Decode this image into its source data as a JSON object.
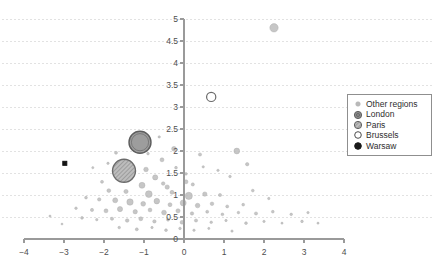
{
  "chart_data": {
    "type": "scatter",
    "title": "",
    "subtitle": "",
    "xlabel": "",
    "ylabel": "",
    "xlim": [
      -4,
      4
    ],
    "ylim": [
      0,
      5
    ],
    "xticks": [
      -4,
      -3,
      -2,
      -1,
      0,
      1,
      2,
      3,
      4
    ],
    "xtick_labels": [
      "−4",
      "−3",
      "−2",
      "−1",
      "0",
      "1",
      "2",
      "3",
      "4"
    ],
    "yticks": [
      0,
      0.5,
      1,
      1.5,
      2,
      2.5,
      3,
      3.5,
      4,
      4.5,
      5
    ],
    "ytick_labels": [
      "0",
      "0.5",
      "1",
      "1.5",
      "2",
      "2.5",
      "3",
      "3.5",
      "4",
      "4.5",
      "5"
    ],
    "grid": {
      "horizontal": true,
      "vertical": false,
      "style": "dotted",
      "color": "#e2e2e2"
    },
    "legend": {
      "position": "top-right",
      "border": true,
      "entries": [
        {
          "label": "Other regions",
          "marker": "filled-circle-small",
          "color": "#b9b9b9"
        },
        {
          "label": "London",
          "marker": "filled-circle-ring",
          "color": "#8c8c8c"
        },
        {
          "label": "Paris",
          "marker": "hatched-circle",
          "color": "#9a9a9a"
        },
        {
          "label": "Brussels",
          "marker": "open-circle",
          "color": "#ffffff"
        },
        {
          "label": "Warsaw",
          "marker": "filled-circle-black",
          "color": "#1a1a1a"
        }
      ]
    },
    "highlighted_points": [
      {
        "name": "London",
        "x": -1.1,
        "y": 2.2,
        "size": 11.0,
        "style": "london"
      },
      {
        "name": "Paris",
        "x": -1.5,
        "y": 1.55,
        "size": 11.5,
        "style": "paris"
      },
      {
        "name": "Brussels",
        "x": 0.68,
        "y": 3.23,
        "size": 4.6,
        "style": "brussels"
      },
      {
        "name": "Warsaw",
        "x": -2.98,
        "y": 1.72,
        "size": 2.0,
        "style": "warsaw"
      }
    ],
    "series": [
      {
        "name": "Other regions",
        "marker": "circle",
        "color": "#b9b9b9",
        "points": [
          {
            "x": 2.25,
            "y": 4.8,
            "r": 4.2
          },
          {
            "x": -0.25,
            "y": 2.05,
            "r": 2.4
          },
          {
            "x": 1.32,
            "y": 2.0,
            "r": 2.9
          },
          {
            "x": 0.4,
            "y": 1.92,
            "r": 1.6
          },
          {
            "x": -0.55,
            "y": 1.8,
            "r": 2.0
          },
          {
            "x": -1.7,
            "y": 1.96,
            "r": 1.5
          },
          {
            "x": -0.95,
            "y": 1.58,
            "r": 2.3
          },
          {
            "x": -0.2,
            "y": 1.62,
            "r": 1.4
          },
          {
            "x": 1.58,
            "y": 1.7,
            "r": 1.7
          },
          {
            "x": -1.28,
            "y": 1.44,
            "r": 1.8
          },
          {
            "x": -0.72,
            "y": 1.4,
            "r": 2.6
          },
          {
            "x": 0.05,
            "y": 1.48,
            "r": 1.3
          },
          {
            "x": -2.05,
            "y": 1.3,
            "r": 1.5
          },
          {
            "x": -1.05,
            "y": 1.22,
            "r": 3.0
          },
          {
            "x": -0.42,
            "y": 1.18,
            "r": 2.2
          },
          {
            "x": 0.22,
            "y": 1.24,
            "r": 1.6
          },
          {
            "x": -1.88,
            "y": 1.1,
            "r": 1.9
          },
          {
            "x": -1.45,
            "y": 1.08,
            "r": 2.1
          },
          {
            "x": -0.88,
            "y": 1.02,
            "r": 3.4
          },
          {
            "x": -0.3,
            "y": 1.06,
            "r": 2.0
          },
          {
            "x": 0.12,
            "y": 0.98,
            "r": 3.6
          },
          {
            "x": 0.52,
            "y": 1.02,
            "r": 2.2
          },
          {
            "x": 0.9,
            "y": 1.0,
            "r": 1.6
          },
          {
            "x": -2.45,
            "y": 0.94,
            "r": 1.4
          },
          {
            "x": -2.12,
            "y": 0.9,
            "r": 1.7
          },
          {
            "x": -1.72,
            "y": 0.88,
            "r": 2.5
          },
          {
            "x": -1.35,
            "y": 0.84,
            "r": 3.2
          },
          {
            "x": -1.02,
            "y": 0.8,
            "r": 2.4
          },
          {
            "x": -0.68,
            "y": 0.86,
            "r": 2.8
          },
          {
            "x": -0.35,
            "y": 0.78,
            "r": 2.0
          },
          {
            "x": -0.02,
            "y": 0.82,
            "r": 3.0
          },
          {
            "x": 0.34,
            "y": 0.76,
            "r": 2.3
          },
          {
            "x": 0.7,
            "y": 0.8,
            "r": 1.8
          },
          {
            "x": 1.08,
            "y": 0.74,
            "r": 1.5
          },
          {
            "x": 1.48,
            "y": 0.78,
            "r": 1.4
          },
          {
            "x": -2.7,
            "y": 0.7,
            "r": 1.3
          },
          {
            "x": -2.3,
            "y": 0.66,
            "r": 1.6
          },
          {
            "x": -1.95,
            "y": 0.64,
            "r": 2.0
          },
          {
            "x": -1.6,
            "y": 0.68,
            "r": 2.6
          },
          {
            "x": -1.22,
            "y": 0.62,
            "r": 2.2
          },
          {
            "x": -0.85,
            "y": 0.66,
            "r": 1.9
          },
          {
            "x": -0.5,
            "y": 0.6,
            "r": 2.4
          },
          {
            "x": -0.15,
            "y": 0.64,
            "r": 2.1
          },
          {
            "x": 0.2,
            "y": 0.58,
            "r": 1.7
          },
          {
            "x": 0.58,
            "y": 0.62,
            "r": 1.5
          },
          {
            "x": 0.96,
            "y": 0.56,
            "r": 1.4
          },
          {
            "x": 1.36,
            "y": 0.6,
            "r": 1.3
          },
          {
            "x": 1.8,
            "y": 0.58,
            "r": 1.6
          },
          {
            "x": 2.22,
            "y": 0.62,
            "r": 1.4
          },
          {
            "x": 2.68,
            "y": 0.56,
            "r": 1.3
          },
          {
            "x": 3.1,
            "y": 0.6,
            "r": 1.2
          },
          {
            "x": -2.55,
            "y": 0.48,
            "r": 1.4
          },
          {
            "x": -2.18,
            "y": 0.44,
            "r": 1.2
          },
          {
            "x": -1.8,
            "y": 0.46,
            "r": 1.6
          },
          {
            "x": -1.42,
            "y": 0.42,
            "r": 1.8
          },
          {
            "x": -1.08,
            "y": 0.46,
            "r": 2.0
          },
          {
            "x": -0.74,
            "y": 0.4,
            "r": 1.7
          },
          {
            "x": -0.4,
            "y": 0.44,
            "r": 1.5
          },
          {
            "x": -0.05,
            "y": 0.38,
            "r": 1.9
          },
          {
            "x": 0.3,
            "y": 0.42,
            "r": 1.6
          },
          {
            "x": 0.68,
            "y": 0.38,
            "r": 1.3
          },
          {
            "x": 1.05,
            "y": 0.42,
            "r": 1.2
          },
          {
            "x": 1.55,
            "y": 0.36,
            "r": 1.4
          },
          {
            "x": 2.0,
            "y": 0.4,
            "r": 1.2
          },
          {
            "x": 2.45,
            "y": 0.36,
            "r": 1.1
          },
          {
            "x": 2.95,
            "y": 0.4,
            "r": 1.3
          },
          {
            "x": 3.35,
            "y": 0.36,
            "r": 1.1
          },
          {
            "x": -1.62,
            "y": 0.26,
            "r": 1.3
          },
          {
            "x": -1.18,
            "y": 0.22,
            "r": 1.5
          },
          {
            "x": -0.8,
            "y": 0.26,
            "r": 1.2
          },
          {
            "x": -0.45,
            "y": 0.2,
            "r": 1.4
          },
          {
            "x": -0.1,
            "y": 0.24,
            "r": 1.3
          },
          {
            "x": 0.25,
            "y": 0.2,
            "r": 1.2
          },
          {
            "x": 0.62,
            "y": 0.24,
            "r": 1.1
          },
          {
            "x": 1.2,
            "y": 0.18,
            "r": 1.2
          },
          {
            "x": -1.9,
            "y": 1.72,
            "r": 1.2
          },
          {
            "x": -0.62,
            "y": 2.32,
            "r": 1.2
          },
          {
            "x": 1.15,
            "y": 1.42,
            "r": 1.3
          },
          {
            "x": 0.85,
            "y": 1.56,
            "r": 1.2
          },
          {
            "x": -2.28,
            "y": 1.62,
            "r": 1.1
          },
          {
            "x": 1.72,
            "y": 1.1,
            "r": 1.4
          },
          {
            "x": 2.12,
            "y": 0.92,
            "r": 1.2
          },
          {
            "x": -3.35,
            "y": 0.52,
            "r": 1.1
          },
          {
            "x": -3.05,
            "y": 0.34,
            "r": 1.0
          },
          {
            "x": 0.48,
            "y": 1.64,
            "r": 1.2
          },
          {
            "x": -0.9,
            "y": 1.94,
            "r": 1.3
          },
          {
            "x": 0.05,
            "y": 1.3,
            "r": 2.0
          },
          {
            "x": -0.52,
            "y": 1.26,
            "r": 1.8
          }
        ]
      }
    ]
  }
}
